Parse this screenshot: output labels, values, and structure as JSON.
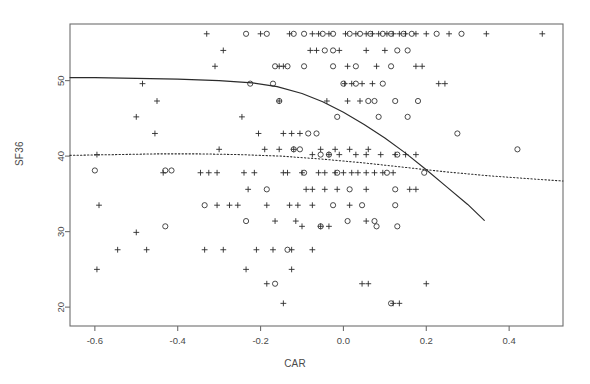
{
  "figure": {
    "title": "",
    "xlabel": "CAR",
    "ylabel": "SF36",
    "background": "#ffffff",
    "frame_color": "#6e6e6e"
  },
  "chart_data": {
    "type": "scatter",
    "title": "",
    "xlabel": "CAR",
    "ylabel": "SF36",
    "xlim": [
      -0.66,
      0.53
    ],
    "ylim": [
      17.5,
      57.5
    ],
    "xticks": [
      -0.6,
      -0.4,
      -0.2,
      0.0,
      0.2,
      0.4
    ],
    "xticklabels": [
      "-0.6",
      "-0.4",
      "-0.2",
      "0.0",
      "0.2",
      "0.4"
    ],
    "yticks": [
      20,
      30,
      40,
      50
    ],
    "yticklabels": [
      "20",
      "30",
      "40",
      "50"
    ],
    "grid": false,
    "legend": null,
    "marker_color": "#2b2b2b",
    "series": [
      {
        "name": "plus-markers",
        "marker": "plus",
        "points": [
          [
            -0.33,
            56.2
          ],
          [
            -0.2,
            56.2
          ],
          [
            -0.13,
            56.2
          ],
          [
            -0.075,
            56.2
          ],
          [
            -0.06,
            56.2
          ],
          [
            -0.035,
            56.2
          ],
          [
            0.005,
            56.2
          ],
          [
            0.03,
            56.2
          ],
          [
            0.055,
            56.2
          ],
          [
            0.07,
            56.2
          ],
          [
            0.085,
            56.2
          ],
          [
            0.105,
            56.2
          ],
          [
            0.12,
            56.2
          ],
          [
            0.135,
            56.2
          ],
          [
            0.15,
            56.2
          ],
          [
            0.175,
            56.2
          ],
          [
            0.2,
            56.2
          ],
          [
            0.255,
            56.2
          ],
          [
            0.345,
            56.2
          ],
          [
            0.48,
            56.2
          ],
          [
            -0.29,
            54.0
          ],
          [
            -0.08,
            54.0
          ],
          [
            -0.065,
            54.0
          ],
          [
            -0.01,
            54.0
          ],
          [
            0.055,
            54.0
          ],
          [
            0.1,
            54.0
          ],
          [
            -0.31,
            51.9
          ],
          [
            -0.155,
            51.9
          ],
          [
            -0.145,
            51.9
          ],
          [
            0.01,
            51.9
          ],
          [
            0.08,
            51.9
          ],
          [
            0.175,
            51.9
          ],
          [
            0.19,
            51.9
          ],
          [
            -0.485,
            49.6
          ],
          [
            0.003,
            49.6
          ],
          [
            0.02,
            49.6
          ],
          [
            0.045,
            49.6
          ],
          [
            0.07,
            49.6
          ],
          [
            0.23,
            49.6
          ],
          [
            0.245,
            49.6
          ],
          [
            -0.45,
            47.3
          ],
          [
            -0.155,
            47.3
          ],
          [
            -0.04,
            47.3
          ],
          [
            0.01,
            47.3
          ],
          [
            0.04,
            47.3
          ],
          [
            -0.5,
            45.2
          ],
          [
            -0.245,
            45.2
          ],
          [
            -0.455,
            43.0
          ],
          [
            -0.205,
            43.0
          ],
          [
            -0.145,
            43.0
          ],
          [
            -0.125,
            43.0
          ],
          [
            -0.105,
            43.0
          ],
          [
            -0.3,
            40.9
          ],
          [
            -0.19,
            40.9
          ],
          [
            -0.155,
            40.9
          ],
          [
            -0.12,
            40.9
          ],
          [
            -0.055,
            40.9
          ],
          [
            -0.02,
            40.9
          ],
          [
            0.015,
            40.9
          ],
          [
            0.06,
            40.9
          ],
          [
            -0.595,
            40.2
          ],
          [
            -0.075,
            40.2
          ],
          [
            -0.035,
            40.2
          ],
          [
            -0.01,
            40.2
          ],
          [
            0.03,
            40.2
          ],
          [
            0.055,
            40.2
          ],
          [
            0.09,
            40.2
          ],
          [
            0.125,
            40.2
          ],
          [
            0.15,
            40.2
          ],
          [
            0.175,
            40.2
          ],
          [
            -0.435,
            37.8
          ],
          [
            -0.345,
            37.8
          ],
          [
            -0.325,
            37.8
          ],
          [
            -0.305,
            37.8
          ],
          [
            -0.24,
            37.8
          ],
          [
            -0.215,
            37.8
          ],
          [
            -0.145,
            37.8
          ],
          [
            -0.135,
            37.8
          ],
          [
            -0.1,
            37.8
          ],
          [
            -0.06,
            37.8
          ],
          [
            -0.045,
            37.8
          ],
          [
            -0.02,
            37.8
          ],
          [
            0.0,
            37.8
          ],
          [
            0.02,
            37.8
          ],
          [
            0.035,
            37.8
          ],
          [
            0.055,
            37.8
          ],
          [
            0.075,
            37.8
          ],
          [
            0.095,
            37.8
          ],
          [
            0.12,
            37.8
          ],
          [
            -0.23,
            35.6
          ],
          [
            -0.09,
            35.6
          ],
          [
            -0.075,
            35.6
          ],
          [
            -0.045,
            35.6
          ],
          [
            -0.015,
            35.6
          ],
          [
            0.055,
            35.6
          ],
          [
            0.16,
            35.6
          ],
          [
            0.175,
            35.6
          ],
          [
            -0.59,
            33.5
          ],
          [
            -0.305,
            33.5
          ],
          [
            -0.275,
            33.5
          ],
          [
            -0.255,
            33.5
          ],
          [
            -0.185,
            33.5
          ],
          [
            -0.13,
            33.5
          ],
          [
            -0.11,
            33.5
          ],
          [
            -0.075,
            33.5
          ],
          [
            0.015,
            33.5
          ],
          [
            -0.165,
            31.4
          ],
          [
            -0.115,
            31.4
          ],
          [
            0.055,
            31.4
          ],
          [
            -0.055,
            30.7
          ],
          [
            -0.1,
            30.7
          ],
          [
            -0.035,
            30.7
          ],
          [
            -0.5,
            29.9
          ],
          [
            -0.545,
            27.6
          ],
          [
            -0.475,
            27.6
          ],
          [
            -0.335,
            27.6
          ],
          [
            -0.29,
            27.6
          ],
          [
            -0.21,
            27.6
          ],
          [
            -0.17,
            27.6
          ],
          [
            -0.125,
            27.6
          ],
          [
            -0.075,
            27.6
          ],
          [
            -0.595,
            25.0
          ],
          [
            -0.235,
            25.0
          ],
          [
            -0.125,
            25.0
          ],
          [
            -0.185,
            23.1
          ],
          [
            0.045,
            23.1
          ],
          [
            0.06,
            23.1
          ],
          [
            0.2,
            23.1
          ],
          [
            -0.145,
            20.5
          ],
          [
            0.12,
            20.5
          ],
          [
            0.135,
            20.5
          ]
        ]
      },
      {
        "name": "circle-markers",
        "marker": "circle",
        "points": [
          [
            -0.235,
            56.2
          ],
          [
            -0.185,
            56.2
          ],
          [
            -0.12,
            56.2
          ],
          [
            -0.095,
            56.2
          ],
          [
            -0.05,
            56.2
          ],
          [
            -0.025,
            56.2
          ],
          [
            0.015,
            56.2
          ],
          [
            0.04,
            56.2
          ],
          [
            0.065,
            56.2
          ],
          [
            0.095,
            56.2
          ],
          [
            0.115,
            56.2
          ],
          [
            0.145,
            56.2
          ],
          [
            0.165,
            56.2
          ],
          [
            0.225,
            56.2
          ],
          [
            0.285,
            56.2
          ],
          [
            -0.045,
            54.0
          ],
          [
            -0.025,
            54.0
          ],
          [
            0.13,
            54.0
          ],
          [
            0.155,
            54.0
          ],
          [
            -0.165,
            51.9
          ],
          [
            -0.135,
            51.9
          ],
          [
            -0.095,
            51.9
          ],
          [
            -0.025,
            51.9
          ],
          [
            0.03,
            51.9
          ],
          [
            0.115,
            51.9
          ],
          [
            -0.225,
            49.6
          ],
          [
            -0.17,
            49.6
          ],
          [
            0.0,
            49.6
          ],
          [
            0.03,
            49.6
          ],
          [
            0.095,
            49.6
          ],
          [
            -0.155,
            47.3
          ],
          [
            0.06,
            47.3
          ],
          [
            0.075,
            47.3
          ],
          [
            0.125,
            47.3
          ],
          [
            0.18,
            47.3
          ],
          [
            -0.015,
            45.2
          ],
          [
            0.085,
            45.2
          ],
          [
            0.155,
            45.2
          ],
          [
            -0.085,
            43.0
          ],
          [
            -0.065,
            43.0
          ],
          [
            0.275,
            43.0
          ],
          [
            -0.12,
            40.9
          ],
          [
            -0.105,
            40.9
          ],
          [
            0.42,
            40.9
          ],
          [
            -0.6,
            38.1
          ],
          [
            -0.43,
            38.1
          ],
          [
            -0.415,
            38.1
          ],
          [
            -0.055,
            40.2
          ],
          [
            -0.035,
            40.2
          ],
          [
            -0.095,
            37.8
          ],
          [
            -0.015,
            37.8
          ],
          [
            0.105,
            37.8
          ],
          [
            0.195,
            37.8
          ],
          [
            -0.185,
            35.6
          ],
          [
            0.015,
            35.6
          ],
          [
            0.125,
            35.6
          ],
          [
            -0.335,
            33.5
          ],
          [
            -0.025,
            33.5
          ],
          [
            0.045,
            33.5
          ],
          [
            0.125,
            33.5
          ],
          [
            -0.235,
            31.4
          ],
          [
            0.01,
            31.4
          ],
          [
            0.075,
            31.4
          ],
          [
            -0.43,
            30.7
          ],
          [
            -0.055,
            30.7
          ],
          [
            0.08,
            30.7
          ],
          [
            0.13,
            30.7
          ],
          [
            -0.135,
            27.6
          ],
          [
            -0.165,
            23.1
          ],
          [
            0.115,
            20.5
          ],
          [
            0.13,
            40.2
          ]
        ]
      }
    ],
    "curves": [
      {
        "name": "solid-fit",
        "style": "solid",
        "color": "#2b2b2b",
        "points": [
          [
            -0.66,
            50.4
          ],
          [
            -0.6,
            50.4
          ],
          [
            -0.5,
            50.3
          ],
          [
            -0.4,
            50.2
          ],
          [
            -0.3,
            50.0
          ],
          [
            -0.22,
            49.7
          ],
          [
            -0.16,
            49.2
          ],
          [
            -0.1,
            48.3
          ],
          [
            -0.05,
            47.2
          ],
          [
            0.0,
            45.8
          ],
          [
            0.05,
            44.2
          ],
          [
            0.1,
            42.4
          ],
          [
            0.15,
            40.4
          ],
          [
            0.2,
            38.2
          ],
          [
            0.25,
            35.9
          ],
          [
            0.3,
            33.6
          ],
          [
            0.34,
            31.5
          ]
        ]
      },
      {
        "name": "dotted-fit",
        "style": "dotted",
        "color": "#2b2b2b",
        "points": [
          [
            -0.66,
            40.1
          ],
          [
            -0.55,
            40.2
          ],
          [
            -0.45,
            40.3
          ],
          [
            -0.35,
            40.3
          ],
          [
            -0.25,
            40.2
          ],
          [
            -0.15,
            40.0
          ],
          [
            -0.05,
            39.6
          ],
          [
            0.05,
            39.1
          ],
          [
            0.15,
            38.5
          ],
          [
            0.25,
            37.9
          ],
          [
            0.35,
            37.4
          ],
          [
            0.45,
            37.0
          ],
          [
            0.53,
            36.7
          ]
        ]
      }
    ]
  }
}
